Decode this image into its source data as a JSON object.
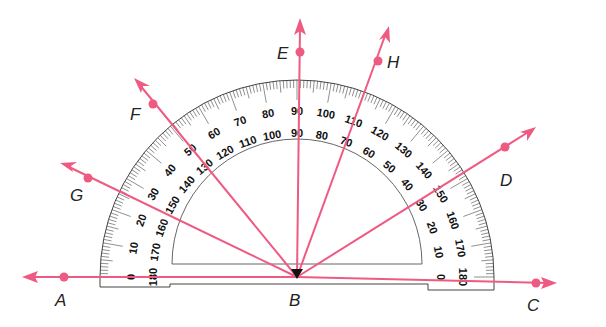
{
  "diagram": {
    "colors": {
      "ray": "#ee5a82",
      "protractor_line": "#333333",
      "text": "#111111",
      "background": "#ffffff"
    },
    "vertex": {
      "label": "B"
    },
    "points": [
      {
        "label": "A",
        "angle": 180
      },
      {
        "label": "G",
        "angle": 160
      },
      {
        "label": "F",
        "angle": 130
      },
      {
        "label": "E",
        "angle": 90
      },
      {
        "label": "H",
        "angle": 70
      },
      {
        "label": "D",
        "angle": 30
      },
      {
        "label": "C",
        "angle": 0
      }
    ],
    "protractor": {
      "outer_scale": [
        "0",
        "10",
        "20",
        "30",
        "40",
        "50",
        "60",
        "70",
        "80",
        "90",
        "100",
        "110",
        "120",
        "130",
        "140",
        "150",
        "160",
        "170",
        "180"
      ],
      "inner_scale": [
        "180",
        "170",
        "160",
        "150",
        "140",
        "130",
        "120",
        "110",
        "100",
        "90",
        "80",
        "70",
        "60",
        "50",
        "40",
        "30",
        "20",
        "10",
        "0"
      ]
    }
  },
  "labels": {
    "A": "A",
    "B": "B",
    "C": "C",
    "D": "D",
    "E": "E",
    "F": "F",
    "G": "G",
    "H": "H"
  }
}
